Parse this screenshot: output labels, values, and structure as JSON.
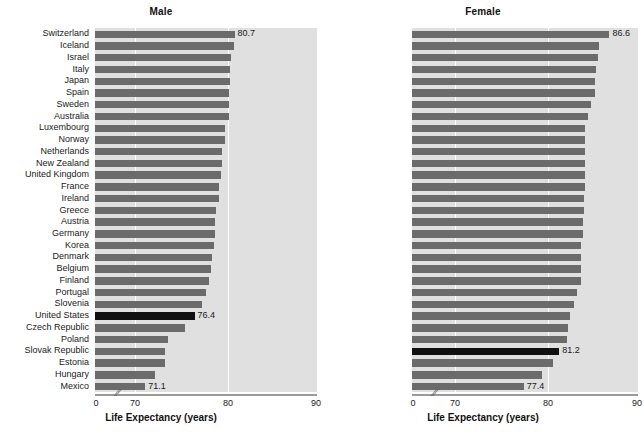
{
  "figure": {
    "axis_title": "Life Expectancy (years)",
    "tick_labels": [
      "0",
      "70",
      "80",
      "90"
    ],
    "tick_values": [
      0,
      70,
      80,
      90
    ],
    "axis_break_glyph": "//",
    "bar_color": "#6b6b6b",
    "highlight_color": "#101010",
    "plot_background": "#e0e0e0",
    "gridline_color": "#ffffff"
  },
  "chart_data": [
    {
      "type": "bar",
      "orientation": "horizontal",
      "title": "Male",
      "xlabel": "Life Expectancy (years)",
      "ylabel": "",
      "xlim": [
        68.5,
        90
      ],
      "xticks": [
        0,
        70,
        80,
        90
      ],
      "grid": true,
      "gridlines_at": [
        70,
        80
      ],
      "legend": "none",
      "highlight_category": "United States",
      "labeled_points": [
        {
          "category": "Switzerland",
          "value": 80.7
        },
        {
          "category": "United States",
          "value": 76.4
        },
        {
          "category": "Mexico",
          "value": 71.1
        }
      ],
      "categories": [
        "Switzerland",
        "Iceland",
        "Israel",
        "Italy",
        "Japan",
        "Spain",
        "Sweden",
        "Australia",
        "Luxembourg",
        "Norway",
        "Netherlands",
        "New Zealand",
        "United Kingdom",
        "France",
        "Ireland",
        "Greece",
        "Austria",
        "Germany",
        "Korea",
        "Denmark",
        "Belgium",
        "Finland",
        "Portugal",
        "Slovenia",
        "United States",
        "Czech Republic",
        "Poland",
        "Slovak Republic",
        "Estonia",
        "Hungary",
        "Mexico"
      ],
      "values": [
        80.7,
        80.6,
        80.3,
        80.2,
        80.2,
        80.1,
        80.1,
        80.1,
        79.7,
        79.7,
        79.4,
        79.4,
        79.2,
        79.0,
        79.0,
        78.7,
        78.6,
        78.6,
        78.5,
        78.3,
        78.2,
        78.0,
        77.6,
        77.2,
        76.4,
        75.4,
        73.6,
        73.2,
        73.2,
        72.2,
        71.1
      ]
    },
    {
      "type": "bar",
      "orientation": "horizontal",
      "title": "Female",
      "xlabel": "Life Expectancy (years)",
      "ylabel": "",
      "xlim": [
        68.5,
        90
      ],
      "xticks": [
        0,
        70,
        80,
        90
      ],
      "grid": true,
      "gridlines_at": [
        70,
        80
      ],
      "legend": "none",
      "highlight_category": "United States",
      "labeled_points": [
        {
          "category": "Japan",
          "value": 86.6
        },
        {
          "category": "United States",
          "value": 81.2
        },
        {
          "category": "Mexico",
          "value": 77.4
        }
      ],
      "categories": [
        "Japan",
        "Spain",
        "France",
        "Italy",
        "Korea",
        "Switzerland",
        "Australia",
        "Finland",
        "Greece",
        "Portugal",
        "Israel",
        "Luxembourg",
        "Austria",
        "Norway",
        "Sweden",
        "Iceland",
        "Slovenia",
        "Belgium",
        "Germany",
        "Netherlands",
        "New Zealand",
        "Ireland",
        "United Kingdom",
        "Denmark",
        "Estonia",
        "Czech Republic",
        "Poland",
        "United States",
        "Slovak Republic",
        "Hungary",
        "Mexico"
      ],
      "values": [
        86.6,
        85.5,
        85.4,
        85.2,
        85.1,
        85.1,
        84.6,
        84.3,
        84.0,
        84.0,
        84.0,
        84.0,
        84.0,
        84.0,
        83.9,
        83.9,
        83.8,
        83.8,
        83.6,
        83.6,
        83.5,
        83.5,
        83.1,
        82.8,
        82.4,
        82.1,
        82.0,
        81.2,
        80.5,
        79.4,
        77.4
      ]
    }
  ]
}
